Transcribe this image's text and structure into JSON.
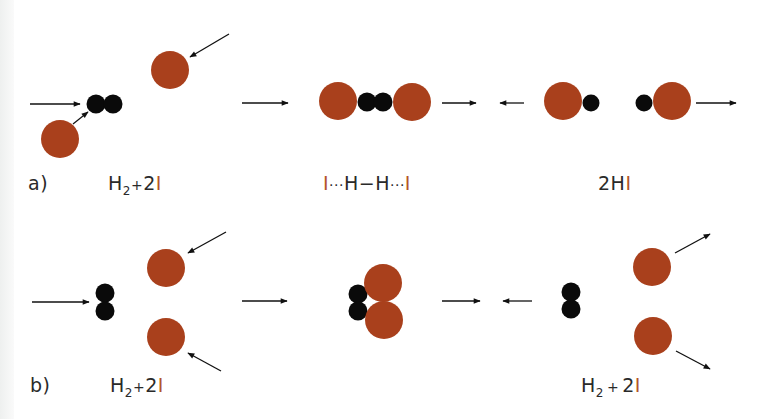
{
  "colors": {
    "iodine": "#a9401c",
    "hydrogen": "#0a0a0a",
    "arrow": "#111111",
    "iodine_text": "#b3552a"
  },
  "row_a": {
    "label": "a)",
    "reactants": {
      "h": "H",
      "sub": "2",
      "plus": "+",
      "coef": "2",
      "i": "I"
    },
    "transition": {
      "i1": "I",
      "dots1": "···",
      "h1": "H",
      "dash": "−",
      "h2": "H",
      "dots2": "···",
      "i2": "I"
    },
    "products": {
      "coef": "2",
      "h": "H",
      "i": "I"
    }
  },
  "row_b": {
    "label": "b)",
    "reactants": {
      "h": "H",
      "sub": "2",
      "plus": "+",
      "coef": "2",
      "i": "I"
    },
    "products": {
      "h": "H",
      "sub": "2",
      "plus": "+",
      "coef": "2",
      "i": "I"
    }
  }
}
